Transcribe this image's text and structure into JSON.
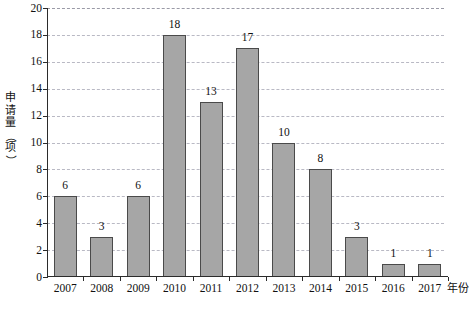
{
  "chart_data": {
    "type": "bar",
    "title": "",
    "subtitle": "",
    "xlabel": "年份",
    "ylabel": "申请量（项）",
    "categories": [
      "2007",
      "2008",
      "2009",
      "2010",
      "2011",
      "2012",
      "2013",
      "2014",
      "2015",
      "2016",
      "2017"
    ],
    "values": [
      6,
      3,
      6,
      18,
      13,
      17,
      10,
      8,
      3,
      1,
      1
    ],
    "data_labels": [
      "6",
      "3",
      "6",
      "18",
      "13",
      "17",
      "10",
      "8",
      "3",
      "1",
      "1"
    ],
    "ylim": [
      0,
      20
    ],
    "ytick_step": 2,
    "ytick_labels": [
      "0",
      "2",
      "4",
      "6",
      "8",
      "10",
      "12",
      "14",
      "16",
      "18",
      "20"
    ],
    "grid": true,
    "grid_axis": "y",
    "grid_style": "dashed",
    "legend": false,
    "legend_position": "none",
    "bar_color": "#a6a6a6",
    "bar_border_color": "#4a4a4a",
    "grid_color": "#b9b9c4",
    "axis_color": "#2b2b2b",
    "background_color": "#ffffff",
    "text_color": "#111111"
  },
  "axis_titles": {
    "y": "申请量（项）",
    "x": "年份"
  }
}
